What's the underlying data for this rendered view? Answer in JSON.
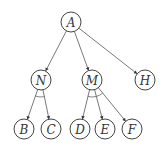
{
  "diagram": {
    "type": "and-or-tree",
    "nodes": [
      {
        "id": "A",
        "label": "A",
        "x": 71,
        "y": 22
      },
      {
        "id": "N",
        "label": "N",
        "x": 41,
        "y": 80
      },
      {
        "id": "M",
        "label": "M",
        "x": 92,
        "y": 80
      },
      {
        "id": "H",
        "label": "H",
        "x": 145,
        "y": 80
      },
      {
        "id": "B",
        "label": "B",
        "x": 24,
        "y": 129
      },
      {
        "id": "C",
        "label": "C",
        "x": 51,
        "y": 129
      },
      {
        "id": "D",
        "label": "D",
        "x": 80,
        "y": 129
      },
      {
        "id": "E",
        "label": "E",
        "x": 105,
        "y": 129
      },
      {
        "id": "F",
        "label": "F",
        "x": 132,
        "y": 129
      }
    ],
    "edges": [
      {
        "from": "A",
        "to": "N"
      },
      {
        "from": "A",
        "to": "M"
      },
      {
        "from": "A",
        "to": "H"
      },
      {
        "from": "N",
        "to": "B"
      },
      {
        "from": "N",
        "to": "C"
      },
      {
        "from": "M",
        "to": "D"
      },
      {
        "from": "M",
        "to": "E"
      },
      {
        "from": "M",
        "to": "F"
      }
    ],
    "and_arcs": [
      {
        "parent": "N",
        "children": [
          "B",
          "C"
        ]
      },
      {
        "parent": "M",
        "children": [
          "D",
          "E"
        ]
      },
      {
        "parent": "M",
        "children": [
          "E",
          "F"
        ]
      }
    ],
    "node_radius": 10,
    "colors": {
      "stroke": "#444444",
      "fill": "#ffffff",
      "text": "#333333"
    }
  }
}
